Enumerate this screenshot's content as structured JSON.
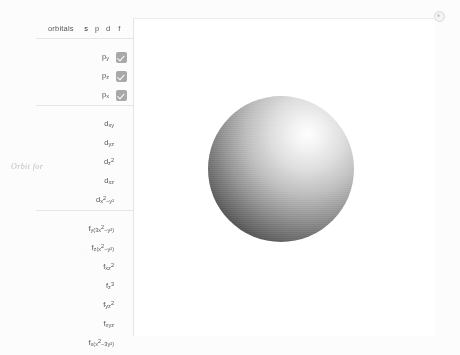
{
  "panel": {
    "header": {
      "title": "orbitals",
      "shells": [
        {
          "label": "s",
          "active": true
        },
        {
          "label": "p",
          "active": false
        },
        {
          "label": "d",
          "active": false
        },
        {
          "label": "f",
          "active": false
        }
      ]
    },
    "p_orbitals": [
      {
        "base": "p",
        "sub": "y",
        "sup": "",
        "checked": true
      },
      {
        "base": "p",
        "sub": "z",
        "sup": "",
        "checked": true
      },
      {
        "base": "p",
        "sub": "x",
        "sup": "",
        "checked": true
      }
    ],
    "d_orbitals": [
      {
        "base": "d",
        "sub": "xy",
        "sup": "",
        "checked": false
      },
      {
        "base": "d",
        "sub": "yz",
        "sup": "",
        "checked": false
      },
      {
        "base": "d",
        "sub": "z",
        "sup": "2",
        "checked": false
      },
      {
        "base": "d",
        "sub": "xz",
        "sup": "",
        "checked": false
      },
      {
        "base": "d",
        "sub": "x",
        "sup": "2",
        "tail": "−y²",
        "checked": false
      }
    ],
    "f_orbitals": [
      {
        "base": "f",
        "sub": "y(3x",
        "sup": "2",
        "tail": "−y²)",
        "checked": false
      },
      {
        "base": "f",
        "sub": "z(x",
        "sup": "2",
        "tail": "−y²)",
        "checked": false
      },
      {
        "base": "f",
        "sub": "xz",
        "sup": "2",
        "checked": false
      },
      {
        "base": "f",
        "sub": "z",
        "sup": "3",
        "checked": false
      },
      {
        "base": "f",
        "sub": "yz",
        "sup": "2",
        "checked": false
      },
      {
        "base": "f",
        "sub": "xyz",
        "sup": "",
        "checked": false
      },
      {
        "base": "f",
        "sub": "x(x",
        "sup": "2",
        "tail": "−3y²)",
        "checked": false
      }
    ]
  },
  "margin_note": {
    "text": "Orbit for"
  },
  "viewport": {
    "rendered_orbital": "s",
    "description": "shaded sphere"
  },
  "icons": {
    "corner": "settings-dot-icon"
  }
}
